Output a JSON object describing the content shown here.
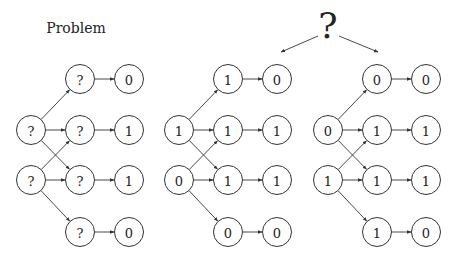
{
  "title": "Problem",
  "question_mark": "?",
  "layout": {
    "node_radius": 14.5,
    "rows_y": [
      79,
      130,
      180,
      232
    ],
    "panels": [
      {
        "cols_x": [
          31,
          80,
          129
        ]
      },
      {
        "cols_x": [
          179,
          228,
          277
        ]
      },
      {
        "cols_x": [
          328,
          377,
          426
        ]
      }
    ]
  },
  "panels": [
    {
      "name": "problem",
      "input": [
        "?",
        "?"
      ],
      "hidden": [
        "?",
        "?",
        "?",
        "?"
      ],
      "output": [
        "0",
        "1",
        "1",
        "0"
      ]
    },
    {
      "name": "solution-a",
      "input": [
        "1",
        "0"
      ],
      "hidden": [
        "1",
        "1",
        "1",
        "0"
      ],
      "output": [
        "0",
        "1",
        "1",
        "0"
      ]
    },
    {
      "name": "solution-b",
      "input": [
        "0",
        "1"
      ],
      "hidden": [
        "0",
        "1",
        "1",
        "1"
      ],
      "output": [
        "0",
        "1",
        "1",
        "0"
      ]
    }
  ],
  "edges_description": {
    "input_to_hidden": [
      [
        0,
        0
      ],
      [
        0,
        1
      ],
      [
        0,
        2
      ],
      [
        1,
        1
      ],
      [
        1,
        2
      ],
      [
        1,
        3
      ]
    ],
    "hidden_to_output": [
      [
        0,
        0
      ],
      [
        1,
        1
      ],
      [
        2,
        2
      ],
      [
        3,
        3
      ]
    ]
  },
  "colors": {
    "stroke": "#333333",
    "text": "#222222",
    "background": "#ffffff"
  }
}
